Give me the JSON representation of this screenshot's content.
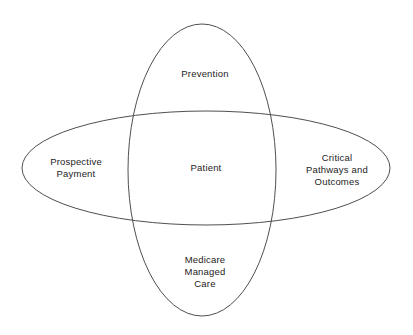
{
  "diagram": {
    "type": "venn",
    "title": "",
    "background_color": "#ffffff",
    "stroke_color": "#4f4f4f",
    "text_color": "#1c1c1c",
    "shapes": [
      {
        "name": "vertical-ellipse",
        "cx": 202,
        "cy": 170,
        "rx": 74,
        "ry": 146
      },
      {
        "name": "horizontal-ellipse",
        "cx": 206,
        "cy": 168,
        "rx": 184,
        "ry": 57
      }
    ],
    "labels": {
      "top": "Prevention",
      "left": "Prospective\nPayment",
      "center": "Patient",
      "right": "Critical\nPathways and\nOutcomes",
      "bottom": "Medicare\nManaged\nCare"
    },
    "label_positions": {
      "top": {
        "x": 205,
        "y": 74
      },
      "left": {
        "x": 76,
        "y": 168
      },
      "center": {
        "x": 206,
        "y": 168
      },
      "right": {
        "x": 337,
        "y": 170
      },
      "bottom": {
        "x": 205,
        "y": 272
      }
    }
  }
}
